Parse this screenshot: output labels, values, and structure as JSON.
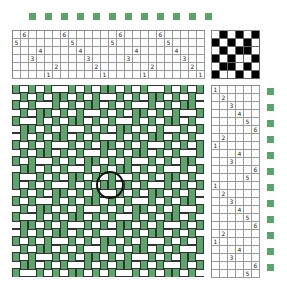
{
  "colors": {
    "warp": "#5aa56a",
    "weft": "#ffffff",
    "tie_black": "#000000",
    "marker": "#5aa56a",
    "cell_border": "#555555"
  },
  "threading": {
    "shafts": 6,
    "sequence": [
      5,
      6,
      3,
      4,
      1,
      2,
      6,
      5,
      4,
      3,
      2,
      1,
      5,
      6,
      3,
      4,
      1,
      2,
      6,
      5,
      4,
      3,
      2,
      1
    ]
  },
  "tieup": [
    [
      0,
      1,
      0,
      1,
      0,
      1
    ],
    [
      1,
      0,
      1,
      0,
      1,
      0
    ],
    [
      0,
      1,
      0,
      1,
      1,
      0
    ],
    [
      1,
      0,
      1,
      0,
      0,
      1
    ],
    [
      0,
      1,
      1,
      0,
      1,
      0
    ],
    [
      1,
      0,
      0,
      1,
      0,
      1
    ]
  ],
  "treadling": {
    "treadles": 6,
    "sequence": [
      1,
      2,
      3,
      4,
      5,
      6,
      2,
      1,
      4,
      3,
      6,
      5,
      1,
      2,
      3,
      4,
      5,
      6,
      2,
      1,
      4,
      3,
      6,
      5
    ]
  },
  "top_markers": 12,
  "right_markers": 12,
  "highlight_circle": {
    "cx": 110,
    "cy": 185,
    "r": 14
  }
}
